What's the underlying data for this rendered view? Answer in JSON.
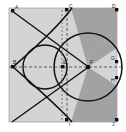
{
  "figure": {
    "type": "geometry-diagram",
    "width": 126,
    "height": 132,
    "colors": {
      "page_background": "#ffffff",
      "plot_background": "#d4d4d4",
      "sector_fill": "#a2a2a2",
      "curve_stroke": "#111111",
      "axis_dash": "#4a4a4a",
      "point_fill": "#111111",
      "label_text": "#222222",
      "border": "#8a8a8a"
    }
  },
  "plot_area": {
    "x": 9,
    "y": 8,
    "width": 108,
    "height": 114
  },
  "axes": {
    "horizontal": {
      "name": "x-axis",
      "style": "dashed",
      "y": 67,
      "x_start": 9,
      "x_end": 121
    },
    "vertical": {
      "name": "y-axis",
      "style": "dashed",
      "x": 67,
      "y_start": 8,
      "y_end": 122
    }
  },
  "points": [
    {
      "id": "A",
      "label": "A",
      "x": 13,
      "y": 11,
      "label_dx": 2,
      "label_dy": -1
    },
    {
      "id": "C",
      "label": "C",
      "x": 67,
      "y": 10,
      "label_dx": 3,
      "label_dy": -1
    },
    {
      "id": "D",
      "label": "D",
      "x": 119,
      "y": 10,
      "label_dx": -6,
      "label_dy": -1
    },
    {
      "id": "B",
      "label": "B",
      "x": 13,
      "y": 67,
      "label_dx": 1,
      "label_dy": -2
    },
    {
      "id": "E",
      "label": "E",
      "x": 67,
      "y": 67,
      "label_dx": 2,
      "label_dy": -2
    },
    {
      "id": "F",
      "label": "F",
      "x": 88,
      "y": 67,
      "label_dx": 2,
      "label_dy": -2
    },
    {
      "id": "G",
      "label": "G",
      "x": 119,
      "y": 62,
      "label_dx": -6,
      "label_dy": -1
    },
    {
      "id": "H",
      "label": "H",
      "x": 119,
      "y": 78,
      "label_dx": -6,
      "label_dy": 4
    },
    {
      "id": "I",
      "label": "I",
      "x": 67,
      "y": 120,
      "label_dx": 3,
      "label_dy": 5
    },
    {
      "id": "J",
      "label": "J",
      "x": 119,
      "y": 120,
      "label_dx": -6,
      "label_dy": 5
    }
  ],
  "shapes": {
    "big_circle": {
      "name": "main-circle",
      "cx": 88,
      "cy": 67,
      "r": 34
    },
    "small_circle": {
      "name": "inner-circle",
      "cx": 45,
      "cy": 67,
      "r": 22
    },
    "deltoid": {
      "name": "deltoid-curve",
      "cusp_left_x": 13,
      "center_y": 67
    },
    "sector_upper": {
      "name": "upper-sector",
      "fill": "#a2a2a2"
    },
    "sector_lower": {
      "name": "lower-sector",
      "fill": "#a2a2a2"
    },
    "line_upper": {
      "name": "chord-upper",
      "x1": 13,
      "y1": 11,
      "x2": 88,
      "y2": 67
    },
    "line_lower": {
      "name": "chord-lower",
      "x1": 13,
      "y1": 122,
      "x2": 88,
      "y2": 67
    }
  }
}
